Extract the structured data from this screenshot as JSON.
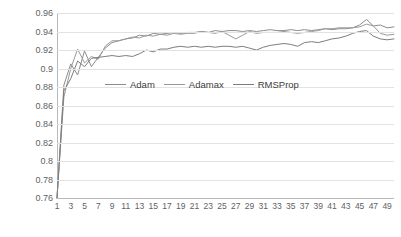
{
  "chart_data": {
    "type": "line",
    "title": "",
    "xlabel": "",
    "ylabel": "",
    "ylim": [
      0.76,
      0.96
    ],
    "ytick_step": 0.02,
    "xlim": [
      1,
      50
    ],
    "grid": true,
    "legend_position": "inside-center-upper",
    "ytick_labels": [
      "0.96",
      "0.94",
      "0.92",
      "0.9",
      "0.88",
      "0.86",
      "0.84",
      "0.82",
      "0.8",
      "0.78",
      "0.76"
    ],
    "ytick_values": [
      0.96,
      0.94,
      0.92,
      0.9,
      0.88,
      0.86,
      0.84,
      0.82,
      0.8,
      0.78,
      0.76
    ],
    "xtick_labels": [
      "1",
      "3",
      "5",
      "7",
      "9",
      "11",
      "13",
      "15",
      "17",
      "19",
      "21",
      "23",
      "25",
      "27",
      "29",
      "31",
      "33",
      "35",
      "37",
      "39",
      "41",
      "43",
      "45",
      "47",
      "49"
    ],
    "xtick_values": [
      1,
      3,
      5,
      7,
      9,
      11,
      13,
      15,
      17,
      19,
      21,
      23,
      25,
      27,
      29,
      31,
      33,
      35,
      37,
      39,
      41,
      43,
      45,
      47,
      49
    ],
    "x": [
      1,
      2,
      3,
      4,
      5,
      6,
      7,
      8,
      9,
      10,
      11,
      12,
      13,
      14,
      15,
      16,
      17,
      18,
      19,
      20,
      21,
      22,
      23,
      24,
      25,
      26,
      27,
      28,
      29,
      30,
      31,
      32,
      33,
      34,
      35,
      36,
      37,
      38,
      39,
      40,
      41,
      42,
      43,
      44,
      45,
      46,
      47,
      48,
      49,
      50
    ],
    "series": [
      {
        "name": "Adam",
        "color": "#8c8c8c",
        "values": [
          0.76,
          0.882,
          0.905,
          0.893,
          0.919,
          0.902,
          0.912,
          0.922,
          0.928,
          0.93,
          0.932,
          0.933,
          0.936,
          0.935,
          0.938,
          0.937,
          0.938,
          0.939,
          0.938,
          0.939,
          0.939,
          0.94,
          0.939,
          0.941,
          0.94,
          0.941,
          0.941,
          0.94,
          0.941,
          0.94,
          0.941,
          0.942,
          0.941,
          0.941,
          0.942,
          0.941,
          0.942,
          0.941,
          0.942,
          0.943,
          0.942,
          0.943,
          0.943,
          0.944,
          0.947,
          0.953,
          0.946,
          0.947,
          0.944,
          0.945
        ]
      },
      {
        "name": "Adamax",
        "color": "#9a9a9a",
        "values": [
          0.76,
          0.869,
          0.9,
          0.921,
          0.906,
          0.913,
          0.91,
          0.924,
          0.93,
          0.93,
          0.932,
          0.934,
          0.933,
          0.936,
          0.935,
          0.937,
          0.936,
          0.938,
          0.937,
          0.938,
          0.938,
          0.94,
          0.939,
          0.938,
          0.94,
          0.936,
          0.932,
          0.936,
          0.94,
          0.938,
          0.939,
          0.939,
          0.939,
          0.94,
          0.939,
          0.938,
          0.939,
          0.94,
          0.941,
          0.943,
          0.943,
          0.944,
          0.944,
          0.944,
          0.945,
          0.948,
          0.946,
          0.938,
          0.936,
          0.937
        ]
      },
      {
        "name": "RMSProp",
        "color": "#7d7d7d",
        "values": [
          0.76,
          0.876,
          0.889,
          0.908,
          0.902,
          0.911,
          0.912,
          0.913,
          0.914,
          0.913,
          0.914,
          0.913,
          0.916,
          0.92,
          0.918,
          0.921,
          0.921,
          0.923,
          0.924,
          0.923,
          0.924,
          0.923,
          0.924,
          0.923,
          0.924,
          0.924,
          0.923,
          0.924,
          0.922,
          0.92,
          0.923,
          0.925,
          0.926,
          0.927,
          0.926,
          0.924,
          0.928,
          0.929,
          0.928,
          0.93,
          0.932,
          0.933,
          0.935,
          0.938,
          0.94,
          0.941,
          0.935,
          0.932,
          0.931,
          0.932
        ]
      }
    ]
  },
  "legend": {
    "entries": [
      {
        "label": "Adam"
      },
      {
        "label": "Adamax"
      },
      {
        "label": "RMSProp"
      }
    ]
  }
}
